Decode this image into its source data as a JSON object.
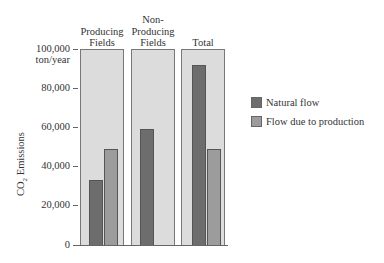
{
  "chart_data": {
    "type": "bar",
    "title": "",
    "xlabel": "",
    "ylabel": "CO2 Emissions",
    "ylabel_display": "CO₂ Emissions",
    "y_unit": "ton/year",
    "ylim": [
      0,
      100000
    ],
    "yticks": [
      0,
      20000,
      40000,
      60000,
      80000,
      100000
    ],
    "ytick_labels": [
      "0",
      "20,000",
      "40,000",
      "60,000",
      "80,000",
      "100,000"
    ],
    "categories": [
      "Producing Fields",
      "Non-Producing Fields",
      "Total"
    ],
    "series": [
      {
        "name": "Natural flow",
        "color": "#6d6d6d",
        "values": [
          33000,
          59000,
          92000
        ]
      },
      {
        "name": "Flow due to production",
        "color": "#9c9c9c",
        "values": [
          49000,
          0,
          49000
        ]
      }
    ],
    "legend_position": "right",
    "grid": false,
    "panel_background": "#dcdcdc"
  },
  "panels": [
    {
      "title_lines": [
        "",
        "Producing",
        "Fields"
      ]
    },
    {
      "title_lines": [
        "Non-",
        "Producing",
        "Fields"
      ]
    },
    {
      "title_lines": [
        "",
        "",
        "Total"
      ]
    }
  ],
  "axis": {
    "top_label_line1": "100,000",
    "top_label_line2": "ton/year",
    "labels": [
      "80,000",
      "60,000",
      "40,000",
      "20,000",
      "0"
    ]
  },
  "legend": {
    "items": [
      {
        "label": "Natural flow"
      },
      {
        "label": "Flow due to production"
      }
    ]
  }
}
